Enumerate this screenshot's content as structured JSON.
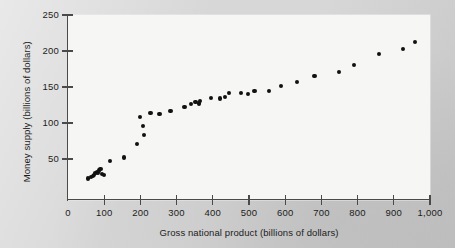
{
  "chart_data": {
    "type": "scatter",
    "title": "",
    "xlabel": "Gross national product  (billions of dollars)",
    "ylabel": "Money supply (billions of dollars)",
    "xlim": [
      0,
      1000
    ],
    "ylim": [
      0,
      250
    ],
    "grid": false,
    "legend": "none",
    "xticks": [
      0,
      100,
      200,
      300,
      400,
      500,
      600,
      700,
      800,
      900,
      1000
    ],
    "xticklabels": [
      "0",
      "100",
      "200",
      "300",
      "400",
      "500",
      "600",
      "700",
      "800",
      "900",
      "1,000"
    ],
    "yticks": [
      50,
      100,
      150,
      200,
      250
    ],
    "yticklabels": [
      "50",
      "100",
      "150",
      "200",
      "250"
    ],
    "marker": "filled-circle",
    "marker_color": "#111111",
    "plot_background": "#f6f6f4",
    "page_background": "#d7d7d7",
    "axis_color": "#4a4a4a",
    "points": [
      {
        "x": 56,
        "y": 23
      },
      {
        "x": 63,
        "y": 25
      },
      {
        "x": 68,
        "y": 26
      },
      {
        "x": 72,
        "y": 28
      },
      {
        "x": 76,
        "y": 30
      },
      {
        "x": 79,
        "y": 32
      },
      {
        "x": 82,
        "y": 31
      },
      {
        "x": 86,
        "y": 34
      },
      {
        "x": 90,
        "y": 36
      },
      {
        "x": 93,
        "y": 29
      },
      {
        "x": 100,
        "y": 28
      },
      {
        "x": 117,
        "y": 47
      },
      {
        "x": 155,
        "y": 52
      },
      {
        "x": 190,
        "y": 71
      },
      {
        "x": 200,
        "y": 108
      },
      {
        "x": 207,
        "y": 96
      },
      {
        "x": 211,
        "y": 83
      },
      {
        "x": 228,
        "y": 114
      },
      {
        "x": 253,
        "y": 112
      },
      {
        "x": 283,
        "y": 117
      },
      {
        "x": 322,
        "y": 122
      },
      {
        "x": 339,
        "y": 126
      },
      {
        "x": 352,
        "y": 129
      },
      {
        "x": 361,
        "y": 127
      },
      {
        "x": 364,
        "y": 130
      },
      {
        "x": 394,
        "y": 135
      },
      {
        "x": 421,
        "y": 134
      },
      {
        "x": 433,
        "y": 136
      },
      {
        "x": 444,
        "y": 142
      },
      {
        "x": 478,
        "y": 142
      },
      {
        "x": 497,
        "y": 140
      },
      {
        "x": 515,
        "y": 144
      },
      {
        "x": 556,
        "y": 145
      },
      {
        "x": 589,
        "y": 151
      },
      {
        "x": 633,
        "y": 157
      },
      {
        "x": 681,
        "y": 165
      },
      {
        "x": 748,
        "y": 171
      },
      {
        "x": 791,
        "y": 180
      },
      {
        "x": 860,
        "y": 196
      },
      {
        "x": 926,
        "y": 203
      },
      {
        "x": 958,
        "y": 213
      }
    ]
  }
}
